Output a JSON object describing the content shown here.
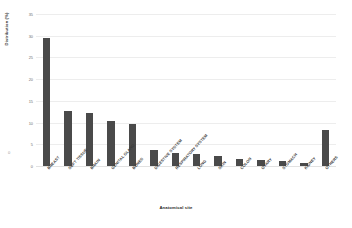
{
  "chart_data": {
    "type": "bar",
    "title": "",
    "xlabel": "Anatomical site",
    "ylabel": "Distribution (%)",
    "categories": [
      "BREAST",
      "SOFT TISSUE",
      "BRAIN",
      "GENITAL GLAND",
      "BONES",
      "DIGESTIVE SYSTEM",
      "RESPIRATORY SYSTEM",
      "LUNG",
      "SKIN",
      "COLON",
      "OVARY",
      "STOMACH",
      "KIDNEY",
      "OTHERS"
    ],
    "values": [
      29.5,
      12.7,
      12.1,
      10.3,
      9.6,
      3.7,
      3.0,
      2.7,
      2.3,
      1.7,
      1.4,
      1.1,
      0.7,
      8.3
    ],
    "ylim": [
      0,
      35
    ],
    "yticks": [
      0,
      5,
      10,
      15,
      20,
      25,
      30,
      35
    ],
    "ytick_labels": [
      "0",
      "5",
      "10",
      "15",
      "20",
      "25",
      "30",
      "35"
    ],
    "grid": true,
    "legend": false,
    "legend_position": "none",
    "bar_color": "#4a4a4a",
    "gridline_color": "#ededed",
    "background_color": "#ffffff"
  },
  "axis": {
    "origin_mark": "0"
  }
}
